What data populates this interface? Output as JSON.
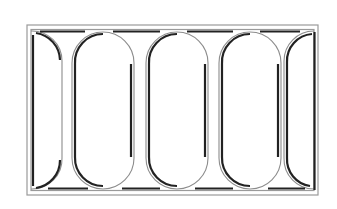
{
  "figure": {
    "colors": {
      "background": "#ffffff",
      "light_line": "#8c8c8c",
      "dark_line": "#222222"
    },
    "frame": {
      "x": 27,
      "y": 25,
      "width": 291,
      "height": 170
    },
    "arch_count_full": 3,
    "arch_count_half": 2,
    "pillar_centers_x": [
      67,
      140,
      214,
      287
    ]
  }
}
